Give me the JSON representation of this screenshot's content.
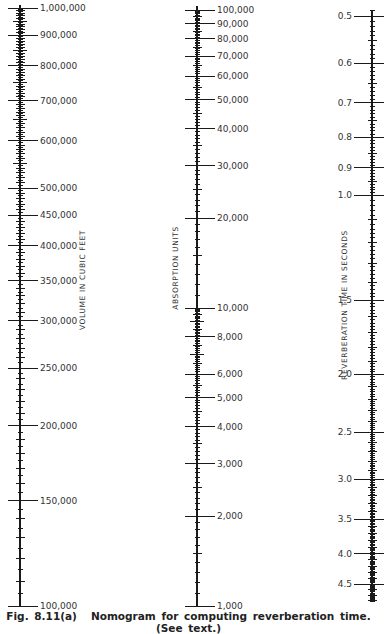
{
  "chart_data": {
    "type": "nomogram",
    "scale": "log",
    "axes": [
      {
        "id": "volume",
        "title": "VOLUME IN CUBIC FEET",
        "range": [
          100000,
          1000000
        ],
        "labeled_ticks": [
          {
            "value": 1000000,
            "label": "1,000,000"
          },
          {
            "value": 900000,
            "label": "900,000"
          },
          {
            "value": 800000,
            "label": "800,000"
          },
          {
            "value": 700000,
            "label": "700,000"
          },
          {
            "value": 600000,
            "label": "600,000"
          },
          {
            "value": 500000,
            "label": "500,000"
          },
          {
            "value": 450000,
            "label": "450,000"
          },
          {
            "value": 400000,
            "label": "400,000"
          },
          {
            "value": 350000,
            "label": "350,000"
          },
          {
            "value": 300000,
            "label": "300,000"
          },
          {
            "value": 250000,
            "label": "250,000"
          },
          {
            "value": 200000,
            "label": "200,000"
          },
          {
            "value": 150000,
            "label": "150,000"
          },
          {
            "value": 100000,
            "label": "100,000"
          }
        ],
        "label_side": "right"
      },
      {
        "id": "absorption",
        "title": "ABSORPTION UNITS",
        "range": [
          1000,
          100000
        ],
        "labeled_ticks": [
          {
            "value": 100000,
            "label": "100,000"
          },
          {
            "value": 90000,
            "label": "90,000"
          },
          {
            "value": 80000,
            "label": "80,000"
          },
          {
            "value": 70000,
            "label": "70,000"
          },
          {
            "value": 60000,
            "label": "60,000"
          },
          {
            "value": 50000,
            "label": "50,000"
          },
          {
            "value": 40000,
            "label": "40,000"
          },
          {
            "value": 30000,
            "label": "30,000"
          },
          {
            "value": 20000,
            "label": "20,000"
          },
          {
            "value": 10000,
            "label": "10,000"
          },
          {
            "value": 8000,
            "label": "8,000"
          },
          {
            "value": 6000,
            "label": "6,000"
          },
          {
            "value": 5000,
            "label": "5,000"
          },
          {
            "value": 4000,
            "label": "4,000"
          },
          {
            "value": 3000,
            "label": "3,000"
          },
          {
            "value": 2000,
            "label": "2,000"
          },
          {
            "value": 1000,
            "label": "1,000"
          }
        ],
        "label_side": "right"
      },
      {
        "id": "reverberation",
        "title": "REVERBERATION TIME IN SECONDS",
        "range": [
          0.48,
          5.0
        ],
        "labeled_ticks": [
          {
            "value": 0.5,
            "label": "0.5"
          },
          {
            "value": 0.6,
            "label": "0.6"
          },
          {
            "value": 0.7,
            "label": "0.7"
          },
          {
            "value": 0.8,
            "label": "0.8"
          },
          {
            "value": 0.9,
            "label": "0.9"
          },
          {
            "value": 1.0,
            "label": "1.0"
          },
          {
            "value": 1.5,
            "label": "1.5"
          },
          {
            "value": 2.0,
            "label": "2.0"
          },
          {
            "value": 2.5,
            "label": "2.5"
          },
          {
            "value": 3.0,
            "label": "3.0"
          },
          {
            "value": 3.5,
            "label": "3.5"
          },
          {
            "value": 4.0,
            "label": "4.0"
          },
          {
            "value": 4.5,
            "label": "4.5"
          }
        ],
        "label_side": "left"
      }
    ],
    "title": "Nomogram for computing reverberation time",
    "grid": false,
    "legend": "none"
  },
  "caption": {
    "figure_label": "Fig. 8.11(a)",
    "text": "Nomogram for computing reverberation time.",
    "note": "(See text.)"
  }
}
